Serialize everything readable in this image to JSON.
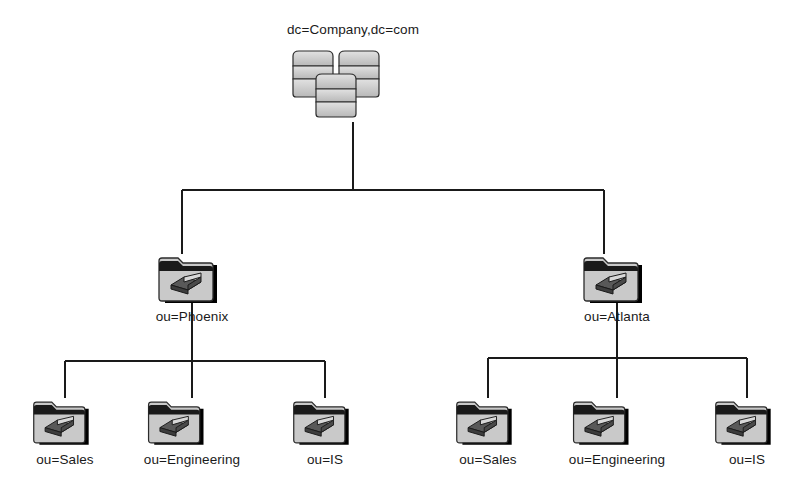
{
  "diagram": {
    "background_color": "#ffffff",
    "line_color": "#1a1a1a",
    "icon_fill": "#c9c9c9",
    "icon_shadow": "#000000",
    "root": {
      "label": "dc=Company,dc=com",
      "icon": "server-cluster-icon"
    },
    "branches": [
      {
        "label": "ou=Phoenix",
        "icon": "folder-book-icon",
        "children": [
          {
            "label": "ou=Sales",
            "icon": "folder-book-icon"
          },
          {
            "label": "ou=Engineering",
            "icon": "folder-book-icon"
          },
          {
            "label": "ou=IS",
            "icon": "folder-book-icon"
          }
        ]
      },
      {
        "label": "ou=Atlanta",
        "icon": "folder-book-icon",
        "children": [
          {
            "label": "ou=Sales",
            "icon": "folder-book-icon"
          },
          {
            "label": "ou=Engineering",
            "icon": "folder-book-icon"
          },
          {
            "label": "ou=IS",
            "icon": "folder-book-icon"
          }
        ]
      }
    ]
  }
}
